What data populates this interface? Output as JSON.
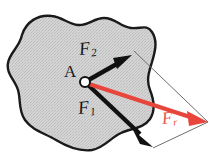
{
  "figure": {
    "type": "force-parallelogram-diagram",
    "background_color": "#ffffff",
    "body": {
      "name": "rigid-body-blob",
      "fill_color": "#d2d2d2",
      "stroke_color": "#1a1a1a",
      "texture": "stippled-gray"
    },
    "point": {
      "label": "A",
      "x": 85,
      "y": 82,
      "marker": "open-circle",
      "marker_fill": "#ffffff",
      "marker_stroke": "#111111"
    },
    "vectors": [
      {
        "id": "F2",
        "label": "F",
        "subscript": "2",
        "color": "#111111",
        "from_x": 85,
        "from_y": 82,
        "to_x": 131,
        "to_y": 55,
        "style": "solid-thick-black-arrow"
      },
      {
        "id": "F1",
        "label": "F",
        "subscript": "1",
        "color": "#111111",
        "from_x": 85,
        "from_y": 82,
        "to_x": 152,
        "to_y": 146,
        "style": "solid-thick-black-arrow"
      },
      {
        "id": "Fr",
        "label": "F",
        "subscript": "r",
        "color": "#e8453c",
        "from_x": 85,
        "from_y": 82,
        "to_x": 207,
        "to_y": 122,
        "style": "solid-thick-red-arrow",
        "role": "resultant"
      }
    ],
    "construction_lines": [
      {
        "id": "from-F2-tip",
        "color": "#7a7a7a",
        "from_x": 134,
        "from_y": 51,
        "to_x": 208,
        "to_y": 122
      },
      {
        "id": "from-F1-tip",
        "color": "#7a7a7a",
        "from_x": 153,
        "from_y": 148,
        "to_x": 208,
        "to_y": 122
      }
    ],
    "labels": {
      "point_a": "A",
      "f_two_base": "F",
      "f_two_sub": "2",
      "f_one_base": "F",
      "f_one_sub": "1",
      "f_r_base": "F",
      "f_r_sub": "r"
    },
    "colors": {
      "red": "#e8453c",
      "black": "#111111",
      "gray_line": "#7a7a7a",
      "body_fill": "#d2d2d2"
    }
  }
}
